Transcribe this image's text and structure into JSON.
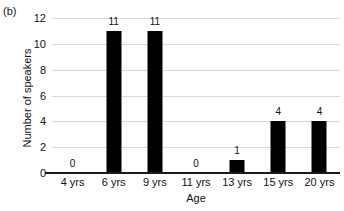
{
  "panel_label": "(b)",
  "chart_data": {
    "type": "bar",
    "title": "",
    "panel": "(b)",
    "categories": [
      "4 yrs",
      "6 yrs",
      "9 yrs",
      "11 yrs",
      "13 yrs",
      "15 yrs",
      "20 yrs"
    ],
    "values": [
      0,
      11,
      11,
      0,
      1,
      4,
      4
    ],
    "data_labels": [
      "0",
      "11",
      "11",
      "0",
      "1",
      "4",
      "4"
    ],
    "xlabel": "Age",
    "ylabel": "Number of speakers",
    "ylim": [
      0,
      12
    ],
    "yticks": [
      0,
      2,
      4,
      6,
      8,
      10,
      12
    ],
    "ytick_labels": [
      "0",
      "2",
      "4",
      "6",
      "8",
      "10",
      "12"
    ],
    "grid": "horizontal",
    "legend": "none",
    "bar_color": "#000000",
    "gridline_color": "#d8d8d8",
    "axis_color": "#1a1a1a",
    "background_color": "#ffffff"
  }
}
